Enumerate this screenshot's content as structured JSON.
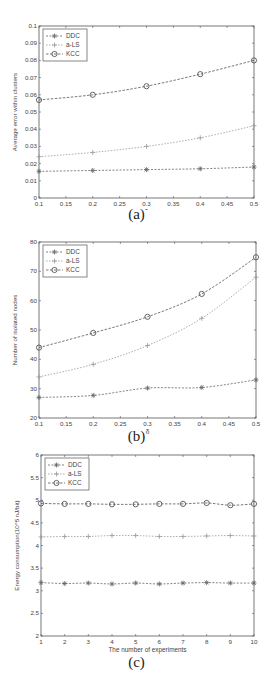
{
  "chart_data": [
    {
      "id": "a",
      "type": "line",
      "caption": "(a)",
      "title": "",
      "xlabel": "δ",
      "ylabel": "Average error within clusters",
      "x": [
        0.1,
        0.2,
        0.3,
        0.4,
        0.5
      ],
      "xlim": [
        0.1,
        0.5
      ],
      "ylim": [
        0,
        0.1
      ],
      "xticks": [
        "0.1",
        "0.15",
        "0.2",
        "0.25",
        "0.3",
        "0.35",
        "0.4",
        "0.45",
        "0.5"
      ],
      "yticks": [
        "0",
        "0.01",
        "0.02",
        "0.03",
        "0.04",
        "0.05",
        "0.06",
        "0.07",
        "0.08",
        "0.09",
        "0.1"
      ],
      "grid": false,
      "legend_position": "upper left",
      "series": [
        {
          "name": "DDC",
          "marker": "asterisk",
          "values": [
            0.0155,
            0.016,
            0.0165,
            0.017,
            0.018
          ]
        },
        {
          "name": "a-LS",
          "marker": "plus",
          "values": [
            0.024,
            0.0265,
            0.03,
            0.035,
            0.042
          ]
        },
        {
          "name": "KCC",
          "marker": "circle",
          "values": [
            0.057,
            0.06,
            0.065,
            0.072,
            0.08
          ]
        }
      ]
    },
    {
      "id": "b",
      "type": "line",
      "caption": "(b)",
      "title": "",
      "xlabel": "δ",
      "ylabel": "Number of isolated nodes",
      "x": [
        0.1,
        0.2,
        0.3,
        0.4,
        0.5
      ],
      "xlim": [
        0.1,
        0.5
      ],
      "ylim": [
        20,
        80
      ],
      "xticks": [
        "0.1",
        "0.15",
        "0.2",
        "0.25",
        "0.3",
        "0.35",
        "0.4",
        "0.45",
        "0.5"
      ],
      "yticks": [
        "20",
        "30",
        "40",
        "50",
        "60",
        "70",
        "80"
      ],
      "grid": false,
      "legend_position": "upper left",
      "series": [
        {
          "name": "DDC",
          "marker": "asterisk",
          "values": [
            27,
            27.7,
            30.2,
            30.4,
            33
          ]
        },
        {
          "name": "a-LS",
          "marker": "plus",
          "values": [
            34,
            38.3,
            44.7,
            54,
            68
          ]
        },
        {
          "name": "KCC",
          "marker": "circle",
          "values": [
            44,
            49,
            54.5,
            62.3,
            74.8
          ]
        }
      ]
    },
    {
      "id": "c",
      "type": "line",
      "caption": "(c)",
      "title": "",
      "xlabel": "The number of experiments",
      "ylabel": "Energy consumption(10^5 nJ/bit)",
      "x": [
        1,
        2,
        3,
        4,
        5,
        6,
        7,
        8,
        9,
        10
      ],
      "xlim": [
        1,
        10
      ],
      "ylim": [
        2,
        6
      ],
      "xticks": [
        "1",
        "2",
        "3",
        "4",
        "5",
        "6",
        "7",
        "8",
        "9",
        "10"
      ],
      "yticks": [
        "2",
        "2.5",
        "3",
        "3.5",
        "4",
        "4.5",
        "5",
        "5.5",
        "6"
      ],
      "grid": false,
      "legend_position": "upper left",
      "series": [
        {
          "name": "DDC",
          "marker": "asterisk",
          "values": [
            3.18,
            3.16,
            3.17,
            3.15,
            3.17,
            3.15,
            3.17,
            3.18,
            3.17,
            3.17
          ]
        },
        {
          "name": "a-LS",
          "marker": "plus",
          "values": [
            4.19,
            4.2,
            4.2,
            4.22,
            4.22,
            4.2,
            4.2,
            4.21,
            4.22,
            4.21
          ]
        },
        {
          "name": "KCC",
          "marker": "circle",
          "values": [
            4.93,
            4.92,
            4.92,
            4.91,
            4.91,
            4.92,
            4.92,
            4.94,
            4.89,
            4.92
          ]
        }
      ]
    }
  ],
  "captions": {
    "a": "(a)",
    "b": "(b)",
    "c": "(c)"
  }
}
